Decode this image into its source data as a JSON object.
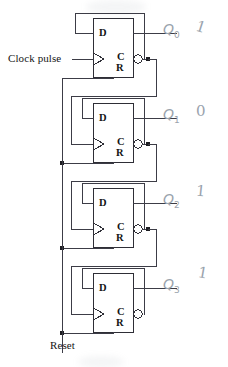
{
  "diagram": {
    "width": 228,
    "height": 367,
    "background": "#ffffff",
    "wire_color": "#3c3c46",
    "text_color": "#141414",
    "pencil_color": "#9aa3ad"
  },
  "inputs": {
    "clock": {
      "label": "Clock pulse",
      "x": 8,
      "y": 58
    },
    "reset": {
      "label": "Reset",
      "x": 50,
      "y": 340
    }
  },
  "flipflops": [
    {
      "id": "ff0",
      "d_label": "D",
      "c_label": "C",
      "r_label": "R",
      "output_label": "Q",
      "output_index": "0",
      "state_value": "1",
      "box": {
        "x": 93,
        "y": 18,
        "w": 41,
        "h": 60
      }
    },
    {
      "id": "ff1",
      "d_label": "D",
      "c_label": "C",
      "r_label": "R",
      "output_label": "Q",
      "output_index": "1",
      "state_value": "0",
      "box": {
        "x": 93,
        "y": 103,
        "w": 41,
        "h": 60
      }
    },
    {
      "id": "ff2",
      "d_label": "D",
      "c_label": "C",
      "r_label": "R",
      "output_label": "Q",
      "output_index": "2",
      "state_value": "1",
      "box": {
        "x": 93,
        "y": 188,
        "w": 41,
        "h": 60
      }
    },
    {
      "id": "ff3",
      "d_label": "D",
      "c_label": "C",
      "r_label": "R",
      "output_label": "Q",
      "output_index": "3",
      "state_value": "1",
      "box": {
        "x": 93,
        "y": 273,
        "w": 41,
        "h": 60
      }
    }
  ],
  "annotations": [
    {
      "name": "q0-annotation",
      "text": "Q",
      "sub": "0",
      "bit": "1",
      "x": 163,
      "y": 26,
      "bit_x": 196,
      "bit_y": 22
    },
    {
      "name": "q1-annotation",
      "text": "Q",
      "sub": "1",
      "bit": "0",
      "x": 163,
      "y": 111,
      "bit_x": 196,
      "bit_y": 107
    },
    {
      "name": "q2-annotation",
      "text": "Q",
      "sub": "2",
      "bit": "1",
      "x": 163,
      "y": 196,
      "bit_x": 196,
      "bit_y": 188
    },
    {
      "name": "q3-annotation",
      "text": "Q",
      "sub": "3",
      "bit": "1",
      "x": 163,
      "y": 281,
      "bit_x": 198,
      "bit_y": 270
    }
  ]
}
